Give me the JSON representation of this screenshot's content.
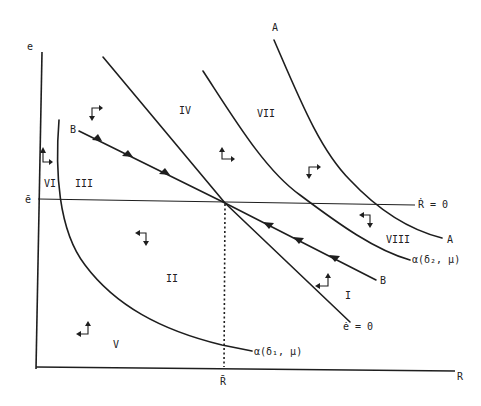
{
  "figure": {
    "type": "phase diagram",
    "axes": {
      "y_label": "e",
      "x_label": "R",
      "y_equilibrium_label": "ē",
      "x_equilibrium_label": "R̄"
    },
    "loci": {
      "r_dot_zero": "Ṙ = 0",
      "e_dot_zero": "ė = 0",
      "alpha_delta1": "α(δ₁, μ)",
      "alpha_delta2": "α(δ₂, μ)",
      "curve_a_top": "A",
      "curve_a_end": "A",
      "saddle_path_start": "B",
      "saddle_path_end": "B"
    },
    "regions": {
      "I": "I",
      "II": "II",
      "III": "III",
      "IV": "IV",
      "V": "V",
      "VI": "VI",
      "VII": "VII",
      "VIII": "VIII"
    },
    "direction_arrows": [
      {
        "region": "VI",
        "directions": "up-right"
      },
      {
        "region": "III",
        "directions": "down-right"
      },
      {
        "region": "IV",
        "directions": "up-right"
      },
      {
        "region": "VII",
        "directions": "down-right"
      },
      {
        "region": "VIII",
        "directions": "down-left"
      },
      {
        "region": "II",
        "directions": "down-left"
      },
      {
        "region": "I",
        "directions": "up-left"
      },
      {
        "region": "V",
        "directions": "up-left"
      }
    ],
    "colors": {
      "ink": "#1e1e1e",
      "background": "#ffffff"
    }
  }
}
